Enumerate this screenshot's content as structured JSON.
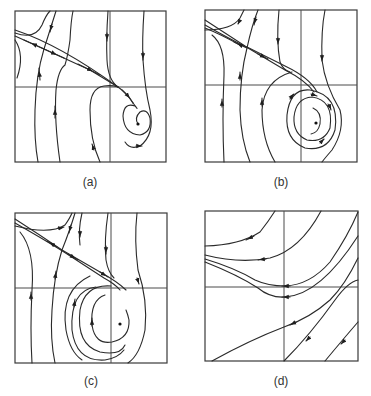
{
  "figure": {
    "colors": {
      "ink": "#2a2a2a",
      "background": "#ffffff"
    },
    "panels": [
      {
        "id": "a",
        "label": "(a)",
        "behavior": "saddle with stable spiral focus (trajectories spiral inward to fixed point)"
      },
      {
        "id": "b",
        "label": "(b)",
        "behavior": "saddle with focus surrounded by closed orbit / limit cycle"
      },
      {
        "id": "c",
        "label": "(c)",
        "behavior": "saddle with unstable spiral; trajectories spiral outward"
      },
      {
        "id": "d",
        "label": "(d)",
        "behavior": "no fixed points; all trajectories flow from upper-right toward left"
      }
    ]
  }
}
